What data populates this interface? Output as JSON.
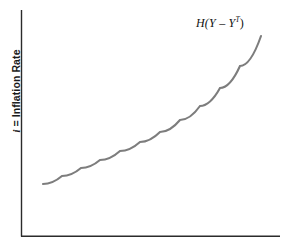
{
  "figure": {
    "y_axis_label": "i = Inflation Rate",
    "y_axis_label_var": "i",
    "y_axis_label_rest": " = Inflation Rate",
    "curve_label_prefix": "H(",
    "curve_label_y1": "Y",
    "curve_label_minus": " – ",
    "curve_label_y2": "Y",
    "curve_label_sup": "T",
    "curve_label_suffix": ")",
    "curve_label_full": "H(Y – Y^T)",
    "axis_color": "#2b2b2b",
    "curve_color": "#7d7d7d",
    "background_color": "#ffffff"
  },
  "chart_data": {
    "type": "line",
    "title": "",
    "subtitle": "",
    "xlabel": "",
    "ylabel": "i = Inflation Rate",
    "grid": false,
    "legend": "none",
    "annotations": [
      {
        "text": "H(Y – Y^T)",
        "x": 196,
        "y": 22,
        "anchor": "curve-upper-right"
      }
    ],
    "axes": {
      "x_axis_from": [
        21,
        236
      ],
      "x_axis_to": [
        280,
        236
      ],
      "y_axis_from": [
        21,
        236
      ],
      "y_axis_to": [
        21,
        10
      ],
      "x_ticks": [],
      "y_ticks": [],
      "xlim": [
        0,
        1
      ],
      "ylim": [
        0,
        1
      ]
    },
    "series": [
      {
        "name": "H(Y – Y^T)",
        "color": "#7d7d7d",
        "linewidth": 2,
        "shape": "convex-increasing",
        "points_px": [
          [
            43,
            184
          ],
          [
            62,
            176
          ],
          [
            81,
            168
          ],
          [
            100,
            160
          ],
          [
            120,
            151
          ],
          [
            140,
            142
          ],
          [
            160,
            132
          ],
          [
            180,
            120
          ],
          [
            200,
            106
          ],
          [
            220,
            88
          ],
          [
            240,
            66
          ],
          [
            261,
            36
          ]
        ]
      }
    ]
  }
}
